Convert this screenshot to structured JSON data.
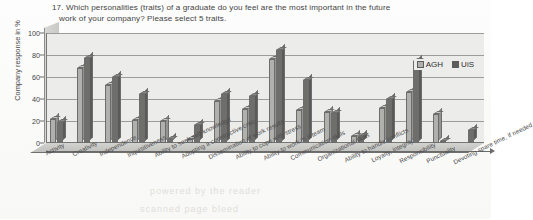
{
  "chart_data": {
    "type": "bar",
    "title": "17. Which personalities  (traits) of a graduate do you feel are the most important in the future work of your company? Please select 5 traits.",
    "title_line1": "17. Which personalities  (traits) of a graduate do you feel are the most important in the future",
    "title_line2": "work of your company? Please select 5 traits.",
    "xlabel": "",
    "ylabel": "Company response in %",
    "ylim": [
      0,
      100
    ],
    "yticks": [
      0,
      20,
      40,
      60,
      80,
      100
    ],
    "grid": true,
    "legend_position": "top-right",
    "categories": [
      "Activity",
      "Creativity",
      "Independence",
      "Inquisitiveness",
      "Ability to seek self-knowledge",
      "Adopting a constructive critic",
      "Dissemination of work results",
      "Ability to cope with stress",
      "Ability to work in a team",
      "Communication skills",
      "Organizational skills",
      "Ability to handle conflicts",
      "Loyalty, integrity",
      "Responsibility",
      "Punctuality",
      "Devoting spare time, if needed"
    ],
    "series": [
      {
        "name": "AGH",
        "color": "#b0b0ad",
        "values": [
          22,
          68,
          53,
          21,
          20,
          4,
          38,
          31,
          76,
          30,
          28,
          6,
          32,
          46,
          26,
          0
        ]
      },
      {
        "name": "UiS",
        "color": "#5d5d5a",
        "values": [
          19,
          77,
          60,
          45,
          4,
          16,
          45,
          43,
          85,
          57,
          27,
          6,
          40,
          75,
          2,
          12
        ]
      }
    ]
  },
  "legend": {
    "items": [
      {
        "label": "AGH"
      },
      {
        "label": "UiS"
      }
    ]
  },
  "ghost_text": {
    "line1": "powered by the reader",
    "line2": "scanned page bleed"
  }
}
